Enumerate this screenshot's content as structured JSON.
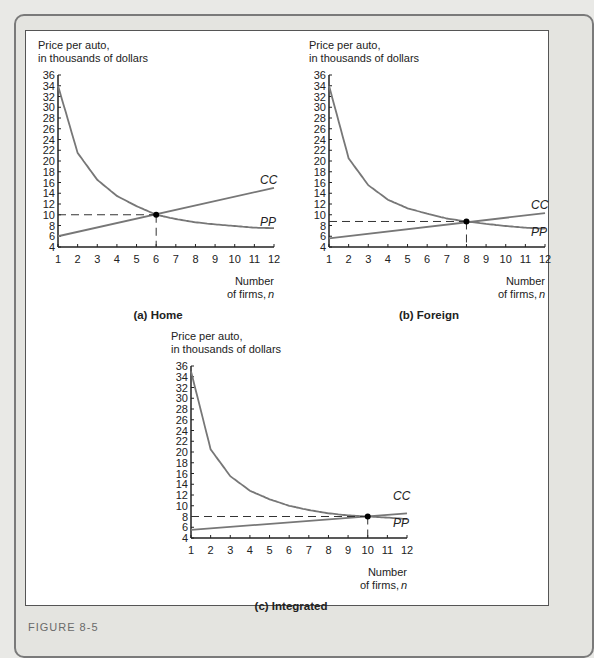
{
  "figure_label": "FIGURE 8-5",
  "chart_data": [
    {
      "type": "line",
      "caption": "(a) Home",
      "ylabel": "Price per auto, in thousands of dollars",
      "xlabel": "Number of firms, n",
      "xlim": [
        1,
        12
      ],
      "ylim": [
        4,
        36
      ],
      "xticks": [
        1,
        2,
        3,
        4,
        5,
        6,
        7,
        8,
        9,
        10,
        11,
        12
      ],
      "yticks": [
        4,
        6,
        8,
        10,
        12,
        14,
        16,
        18,
        20,
        22,
        24,
        26,
        28,
        30,
        32,
        34,
        36
      ],
      "series": [
        {
          "name": "CC",
          "x": [
            1,
            2,
            3,
            4,
            5,
            6,
            7,
            8,
            9,
            10,
            11,
            12
          ],
          "values": [
            34,
            21.5,
            16.5,
            13.5,
            11.6,
            10,
            9.2,
            8.6,
            8.2,
            7.9,
            7.6,
            7.5
          ]
        },
        {
          "name": "PP",
          "x": [
            1,
            12
          ],
          "values": [
            6,
            15
          ]
        }
      ],
      "equilibrium": {
        "n": 6,
        "price": 10
      },
      "labels": {
        "cc": "CC",
        "pp": "PP"
      }
    },
    {
      "type": "line",
      "caption": "(b) Foreign",
      "ylabel": "Price per auto, in thousands of dollars",
      "xlabel": "Number of firms, n",
      "xlim": [
        1,
        12
      ],
      "ylim": [
        4,
        36
      ],
      "xticks": [
        1,
        2,
        3,
        4,
        5,
        6,
        7,
        8,
        9,
        10,
        11,
        12
      ],
      "yticks": [
        4,
        6,
        8,
        10,
        12,
        14,
        16,
        18,
        20,
        22,
        24,
        26,
        28,
        30,
        32,
        34,
        36
      ],
      "series": [
        {
          "name": "CC",
          "x": [
            1,
            2,
            3,
            4,
            5,
            6,
            7,
            8,
            9,
            10,
            11,
            12
          ],
          "values": [
            34,
            20.5,
            15.5,
            12.8,
            11.2,
            10.2,
            9.3,
            8.75,
            8.3,
            7.9,
            7.6,
            7.4
          ]
        },
        {
          "name": "PP",
          "x": [
            1,
            12
          ],
          "values": [
            5.6,
            10.3
          ]
        }
      ],
      "equilibrium": {
        "n": 8,
        "price": 8.75
      },
      "labels": {
        "cc": "CC",
        "pp": "PP"
      }
    },
    {
      "type": "line",
      "caption": "(c) Integrated",
      "ylabel": "Price per auto, in thousands of dollars",
      "xlabel": "Number of firms, n",
      "xlim": [
        1,
        12
      ],
      "ylim": [
        4,
        36
      ],
      "xticks": [
        1,
        2,
        3,
        4,
        5,
        6,
        7,
        8,
        9,
        10,
        11,
        12
      ],
      "yticks": [
        4,
        6,
        8,
        10,
        12,
        14,
        16,
        18,
        20,
        22,
        24,
        26,
        28,
        30,
        32,
        34,
        36
      ],
      "series": [
        {
          "name": "CC",
          "x": [
            1,
            2,
            3,
            4,
            5,
            6,
            7,
            8,
            9,
            10,
            11,
            12
          ],
          "values": [
            35,
            20.5,
            15.5,
            12.8,
            11.2,
            10,
            9.2,
            8.6,
            8.2,
            8,
            7.8,
            7.5
          ]
        },
        {
          "name": "PP",
          "x": [
            1,
            12
          ],
          "values": [
            5.5,
            8.6
          ]
        }
      ],
      "equilibrium": {
        "n": 10,
        "price": 8
      },
      "labels": {
        "cc": "CC",
        "pp": "PP"
      }
    }
  ],
  "text": {
    "ylabel_line1": "Price per auto,",
    "ylabel_line2": "in thousands of dollars",
    "xlabel_line1": "Number",
    "xlabel_line2": "of firms,",
    "xlabel_var": "n"
  }
}
